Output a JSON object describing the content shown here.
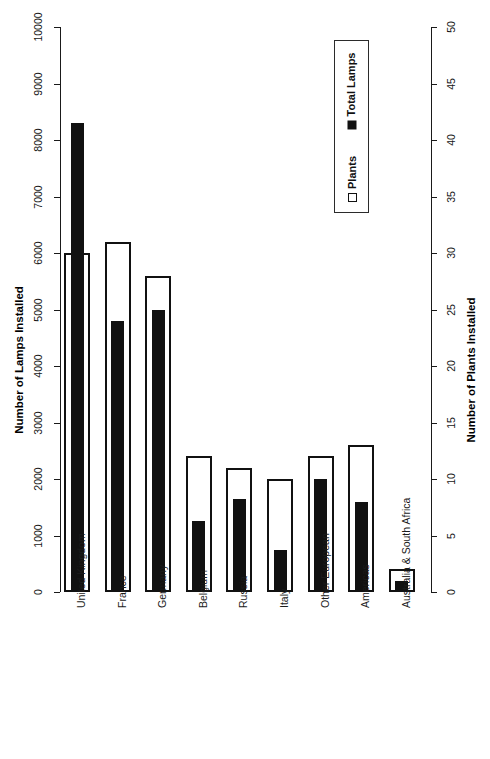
{
  "chart_data": {
    "type": "bar",
    "title": "",
    "categories": [
      "United Kingdom",
      "France",
      "Germany",
      "Belgium",
      "Russia",
      "Italy",
      "Other European",
      "Americas",
      "Australia & South Africa"
    ],
    "series": [
      {
        "name": "Total Lamps",
        "axis": "left",
        "color": "#111111",
        "style": "filled",
        "values": [
          8300,
          4800,
          5000,
          1250,
          1650,
          750,
          2000,
          1600,
          200
        ]
      },
      {
        "name": "Plants",
        "axis": "right",
        "color": "#ffffff",
        "style": "hollow",
        "values": [
          30,
          31,
          28,
          12,
          11,
          10,
          12,
          13,
          2
        ]
      }
    ],
    "left_axis": {
      "label": "Number of Lamps Installed",
      "ticks": [
        0,
        1000,
        2000,
        3000,
        4000,
        5000,
        6000,
        7000,
        8000,
        9000,
        10000
      ],
      "ylim": [
        0,
        10000
      ]
    },
    "right_axis": {
      "label": "Number of Plants Installed",
      "ticks": [
        0,
        5,
        10,
        15,
        20,
        25,
        30,
        35,
        40,
        45,
        50
      ],
      "ylim": [
        0,
        50
      ]
    },
    "grid": false,
    "legend": {
      "position": "top-right",
      "entries": [
        {
          "label": "Total Lamps",
          "swatch": "filled"
        },
        {
          "label": "Plants",
          "swatch": "hollow"
        }
      ]
    }
  }
}
